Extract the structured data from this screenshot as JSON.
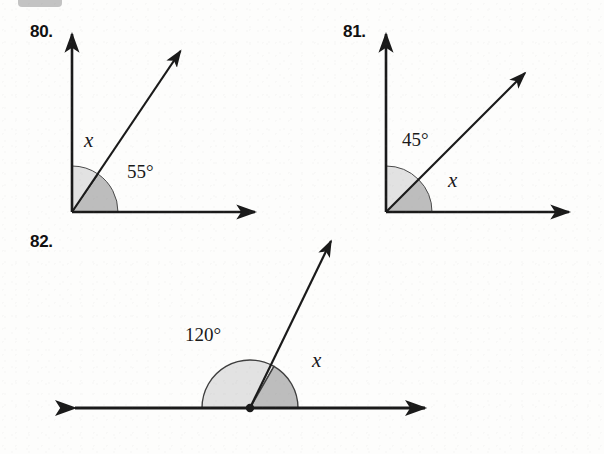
{
  "page": {
    "background_color": "#fdfdfc",
    "ink_color": "#1a1a1a",
    "wedge_light_color": "#e0e0e0",
    "wedge_dark_color": "#b8b8b8"
  },
  "exercises": [
    {
      "number": "80.",
      "number_pos": {
        "x": 30,
        "y": 22
      },
      "type": "angle-diagram",
      "vertex": {
        "x": 72,
        "y": 212
      },
      "rays": [
        {
          "name": "vertical-ray",
          "angle_deg": 90,
          "length": 182,
          "arrow": "end"
        },
        {
          "name": "diagonal-ray",
          "angle_deg": 55,
          "length": 205,
          "arrow": "end"
        },
        {
          "name": "horizontal-ray",
          "angle_deg": 0,
          "length": 190,
          "arrow": "end"
        }
      ],
      "wedges": [
        {
          "name": "angle-x-wedge",
          "from_deg": 55,
          "to_deg": 90,
          "radius": 46,
          "shade": "light"
        },
        {
          "name": "angle-55-wedge",
          "from_deg": 0,
          "to_deg": 55,
          "radius": 46,
          "shade": "dark"
        }
      ],
      "labels": [
        {
          "name": "angle-label-x",
          "text": "x",
          "italic": true,
          "x": 84,
          "y": 128
        },
        {
          "name": "angle-label-55",
          "text": "55°",
          "italic": false,
          "x": 127,
          "y": 161
        }
      ]
    },
    {
      "number": "81.",
      "number_pos": {
        "x": 343,
        "y": 22
      },
      "type": "angle-diagram",
      "vertex": {
        "x": 386,
        "y": 212
      },
      "rays": [
        {
          "name": "vertical-ray",
          "angle_deg": 90,
          "length": 182,
          "arrow": "end"
        },
        {
          "name": "diagonal-ray",
          "angle_deg": 45,
          "length": 208,
          "arrow": "end"
        },
        {
          "name": "horizontal-ray",
          "angle_deg": 0,
          "length": 190,
          "arrow": "end"
        }
      ],
      "wedges": [
        {
          "name": "angle-45-wedge",
          "from_deg": 45,
          "to_deg": 90,
          "radius": 46,
          "shade": "light"
        },
        {
          "name": "angle-x-wedge",
          "from_deg": 0,
          "to_deg": 45,
          "radius": 46,
          "shade": "dark"
        }
      ],
      "labels": [
        {
          "name": "angle-label-45",
          "text": "45°",
          "italic": false,
          "x": 402,
          "y": 129
        },
        {
          "name": "angle-label-x",
          "text": "x",
          "italic": true,
          "x": 448,
          "y": 168
        }
      ]
    },
    {
      "number": "82.",
      "number_pos": {
        "x": 30,
        "y": 232
      },
      "type": "straight-angle-diagram",
      "vertex": {
        "x": 250,
        "y": 408
      },
      "vertex_dot": true,
      "rays": [
        {
          "name": "line-left-ray",
          "angle_deg": 180,
          "length": 182,
          "arrow": "end"
        },
        {
          "name": "line-right-ray",
          "angle_deg": 0,
          "length": 182,
          "arrow": "end"
        },
        {
          "name": "diagonal-ray",
          "angle_deg": 60,
          "length": 200,
          "arrow": "end"
        }
      ],
      "wedges": [
        {
          "name": "angle-120-wedge",
          "from_deg": 60,
          "to_deg": 180,
          "radius": 48,
          "shade": "light"
        },
        {
          "name": "angle-x-wedge",
          "from_deg": 0,
          "to_deg": 60,
          "radius": 48,
          "shade": "dark"
        }
      ],
      "labels": [
        {
          "name": "angle-label-120",
          "text": "120°",
          "italic": false,
          "x": 185,
          "y": 324
        },
        {
          "name": "angle-label-x",
          "text": "x",
          "italic": true,
          "x": 312,
          "y": 348
        }
      ]
    }
  ]
}
